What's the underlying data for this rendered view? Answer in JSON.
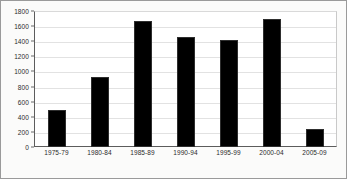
{
  "chart_data": {
    "type": "bar",
    "title": "",
    "subtitle": "",
    "xlabel": "",
    "ylabel": "",
    "categories": [
      "1975-79",
      "1980-84",
      "1985-89",
      "1990-94",
      "1995-99",
      "2000-04",
      "2005-09"
    ],
    "values": [
      490,
      930,
      1670,
      1455,
      1420,
      1690,
      245
    ],
    "ylim": [
      0,
      1800
    ],
    "ytick_step": 200,
    "yticks": [
      0,
      200,
      400,
      600,
      800,
      1000,
      1200,
      1400,
      1600,
      1800
    ],
    "ytick_labels": [
      "0",
      "200",
      "400",
      "600",
      "800",
      "1000",
      "1200",
      "1400",
      "1600",
      "1800"
    ],
    "grid": true,
    "grid_axis": "y",
    "legend": false,
    "legend_position": "none",
    "series": [
      {
        "name": "",
        "values": [
          490,
          930,
          1670,
          1455,
          1420,
          1690,
          245
        ]
      }
    ]
  },
  "colors": {
    "bar": "#000000",
    "bar_edge": "#2e2e2e",
    "gridline": "#e2e2e2",
    "axis": "#5c5c5c",
    "frame": "#9a9a9a",
    "plot_background": "#ffffff",
    "figure_background": "#fbfbfa",
    "tick_label": "#2b2b2b"
  }
}
